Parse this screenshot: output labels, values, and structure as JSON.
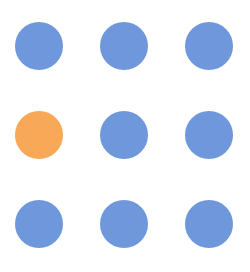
{
  "grid": {
    "rows": 3,
    "cols": 3,
    "col_centers": [
      39,
      124,
      209
    ],
    "row_centers": [
      46,
      135,
      224
    ],
    "dot_diameter": 48,
    "colors": {
      "default": "#6f98dc",
      "highlight": "#f9a857"
    },
    "dots": [
      {
        "row": 0,
        "col": 0,
        "state": "default"
      },
      {
        "row": 0,
        "col": 1,
        "state": "default"
      },
      {
        "row": 0,
        "col": 2,
        "state": "default"
      },
      {
        "row": 1,
        "col": 0,
        "state": "highlight"
      },
      {
        "row": 1,
        "col": 1,
        "state": "default"
      },
      {
        "row": 1,
        "col": 2,
        "state": "default"
      },
      {
        "row": 2,
        "col": 0,
        "state": "default"
      },
      {
        "row": 2,
        "col": 1,
        "state": "default"
      },
      {
        "row": 2,
        "col": 2,
        "state": "default"
      }
    ]
  }
}
